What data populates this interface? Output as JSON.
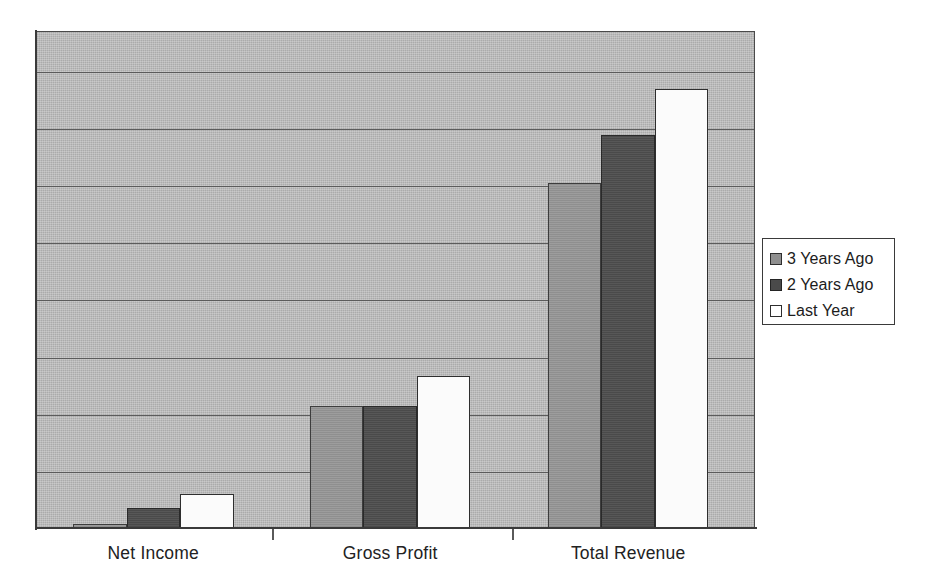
{
  "chart_data": {
    "type": "bar",
    "title": "",
    "xlabel": "",
    "ylabel": "",
    "categories": [
      "Net Income",
      "Gross Profit",
      "Total Revenue"
    ],
    "series": [
      {
        "name": "3 Years Ago",
        "color": "#8f8f8f",
        "values": [
          0.09,
          2.15,
          6.05
        ]
      },
      {
        "name": "2 Years Ago",
        "color": "#4a4a4a",
        "values": [
          0.36,
          2.15,
          6.9
        ]
      },
      {
        "name": "Last Year",
        "color": "#fbfbfb",
        "values": [
          0.62,
          2.68,
          7.7
        ]
      }
    ],
    "ylim": [
      0,
      8.7
    ],
    "y_gridline_count": 8,
    "y_gridline_step": 1,
    "grid": true,
    "legend_position": "right",
    "plot_background": "#ababab",
    "axis_color": "#3a3a3a"
  },
  "legend": {
    "items": [
      {
        "label": "3 Years Ago"
      },
      {
        "label": "2 Years Ago"
      },
      {
        "label": "Last Year"
      }
    ]
  }
}
